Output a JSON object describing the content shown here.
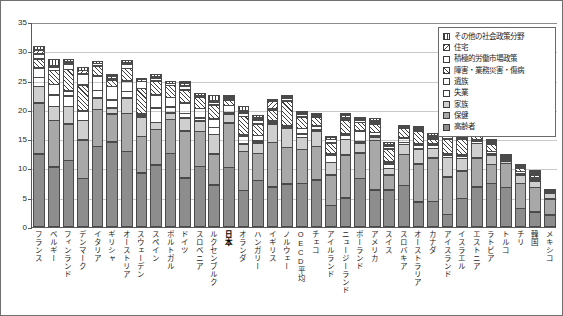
{
  "chart_data": {
    "type": "bar",
    "stacked": true,
    "title": "",
    "subtitle": "",
    "xlabel": "",
    "ylabel": "",
    "ylim": [
      0,
      35
    ],
    "ytick_step": 5,
    "ytick_labels": [
      "0",
      "5",
      "10",
      "15",
      "20",
      "25",
      "30",
      "35"
    ],
    "grid": true,
    "legend_position": "top-right",
    "categories": [
      "フランス",
      "ベルギー",
      "フィンランド",
      "デンマーク",
      "イタリア",
      "ギリシャ",
      "オーストリア",
      "スウェーデン",
      "スペイン",
      "ポルトガル",
      "ドイツ",
      "スロベニア",
      "ルクセンブルク",
      "日本",
      "オランダ",
      "ハンガリー",
      "イギリス",
      "ノルウェー",
      "OECD平均",
      "チェコ",
      "アイルランド",
      "ニュージーランド",
      "ポーランド",
      "アメリカ",
      "スイス",
      "スロバキア",
      "オーストラリア",
      "カナダ",
      "アイスランド",
      "イスラエル",
      "エストニア",
      "ラトビア",
      "トルコ",
      "チリ",
      "韓国",
      "メキシコ"
    ],
    "highlight_category": "日本",
    "series": [
      {
        "name": "高齢者",
        "key": "elderly",
        "values": [
          12.5,
          10.3,
          11.4,
          8.3,
          13.8,
          14.6,
          12.9,
          9.3,
          10.6,
          12.6,
          8.4,
          10.4,
          7.2,
          10.2,
          6.3,
          8.0,
          6.9,
          7.4,
          7.5,
          8.1,
          3.7,
          5.0,
          8.3,
          6.4,
          6.4,
          7.1,
          4.3,
          4.4,
          2.2,
          4.9,
          6.9,
          7.5,
          6.8,
          3.2,
          2.6,
          2.1
        ]
      },
      {
        "name": "保健",
        "key": "health",
        "values": [
          8.8,
          8.0,
          6.3,
          6.7,
          6.4,
          4.8,
          6.6,
          6.3,
          6.2,
          5.9,
          8.1,
          6.0,
          5.4,
          7.7,
          6.7,
          4.7,
          7.7,
          6.3,
          5.9,
          5.8,
          5.3,
          7.4,
          4.5,
          8.5,
          2.6,
          5.4,
          6.6,
          7.5,
          6.5,
          4.8,
          5.0,
          3.3,
          4.2,
          4.4,
          4.3,
          2.8
        ]
      },
      {
        "name": "家族",
        "key": "family",
        "values": [
          2.9,
          2.5,
          3.1,
          3.4,
          2.0,
          1.1,
          2.7,
          3.4,
          1.3,
          1.2,
          2.3,
          1.9,
          3.4,
          1.6,
          1.4,
          1.9,
          3.2,
          3.3,
          2.1,
          2.6,
          2.2,
          2.8,
          1.8,
          0.6,
          1.2,
          1.8,
          2.6,
          1.7,
          3.4,
          2.2,
          2.6,
          1.6,
          0.4,
          1.4,
          1.2,
          1.0
        ]
      },
      {
        "name": "失業",
        "key": "unemployment",
        "values": [
          1.6,
          2.0,
          1.9,
          1.7,
          1.4,
          1.5,
          1.2,
          0.4,
          2.5,
          1.1,
          0.9,
          0.6,
          1.3,
          0.2,
          1.4,
          0.4,
          0.2,
          0.3,
          0.7,
          0.3,
          1.3,
          0.7,
          0.2,
          0.2,
          0.9,
          0.4,
          0.7,
          0.6,
          0.5,
          0.5,
          0.4,
          0.3,
          0.3,
          0.2,
          0.3,
          0.0
        ]
      },
      {
        "name": "遺族",
        "key": "survivors",
        "values": [
          1.7,
          1.9,
          0.9,
          0.0,
          2.6,
          2.4,
          1.9,
          0.4,
          2.3,
          1.7,
          1.9,
          1.7,
          1.5,
          1.3,
          0.2,
          1.0,
          0.1,
          0.3,
          1.0,
          0.8,
          0.3,
          0.2,
          1.8,
          0.7,
          0.4,
          0.9,
          0.2,
          0.3,
          0.2,
          0.4,
          0.1,
          0.5,
          0.2,
          0.5,
          0.3,
          0.3
        ]
      },
      {
        "name": "障害・業務災害・傷病",
        "key": "disability",
        "values": [
          1.7,
          2.5,
          3.8,
          4.5,
          1.8,
          1.2,
          2.2,
          4.3,
          2.5,
          2.1,
          2.3,
          2.1,
          2.5,
          1.0,
          3.2,
          2.1,
          1.9,
          4.3,
          2.1,
          1.5,
          2.0,
          2.5,
          1.6,
          1.5,
          2.3,
          1.7,
          2.3,
          0.9,
          2.6,
          2.6,
          1.4,
          1.4,
          0.3,
          0.6,
          0.6,
          0.1
        ]
      },
      {
        "name": "積極的労働市場政策",
        "key": "almp",
        "values": [
          0.9,
          0.7,
          1.0,
          2.0,
          0.5,
          0.2,
          0.8,
          1.3,
          0.6,
          0.5,
          0.7,
          0.3,
          0.5,
          0.2,
          0.7,
          0.7,
          0.2,
          0.5,
          0.5,
          0.3,
          0.7,
          0.4,
          0.4,
          0.1,
          0.6,
          0.2,
          0.3,
          0.2,
          0.6,
          0.2,
          0.2,
          0.2,
          0.1,
          0.1,
          0.3,
          0.0
        ]
      },
      {
        "name": "住宅",
        "key": "housing",
        "values": [
          0.8,
          0.2,
          0.4,
          0.7,
          0.0,
          0.5,
          0.1,
          0.4,
          0.1,
          0.0,
          0.6,
          0.0,
          0.4,
          0.1,
          0.4,
          0.5,
          1.4,
          0.1,
          0.3,
          0.1,
          0.4,
          0.6,
          0.1,
          0.3,
          0.2,
          0.0,
          0.3,
          0.4,
          0.1,
          0.1,
          0.0,
          0.2,
          0.0,
          0.1,
          0.1,
          0.0
        ]
      },
      {
        "name": "その他の社会政策分野",
        "key": "other",
        "values": [
          0.7,
          1.2,
          0.6,
          0.7,
          0.4,
          0.4,
          0.5,
          0.4,
          0.4,
          0.5,
          0.4,
          0.4,
          1.1,
          0.3,
          1.0,
          0.6,
          0.2,
          0.1,
          0.3,
          0.2,
          0.3,
          0.3,
          0.2,
          0.5,
          0.4,
          0.1,
          0.4,
          0.5,
          0.4,
          0.3,
          0.1,
          0.2,
          0.2,
          0.2,
          0.4,
          0.2
        ]
      }
    ],
    "legend_entries": [
      "その他の社会政策分野",
      "住宅",
      "積極的労働市場政策",
      "障害・業務災害・傷病",
      "遺族",
      "失業",
      "家族",
      "保健",
      "高齢者"
    ]
  }
}
